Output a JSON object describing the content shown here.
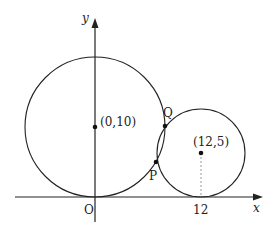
{
  "diagram": {
    "axes": {
      "x_label": "x",
      "y_label": "y",
      "origin_label": "O"
    },
    "circle_large": {
      "center_label": "(0,10)",
      "center": [
        0,
        10
      ],
      "radius": 10
    },
    "circle_small": {
      "center_label": "(12,5)",
      "center": [
        12,
        5
      ],
      "radius": 5
    },
    "tick_label": "12",
    "points": {
      "P": "P",
      "Q": "Q"
    }
  }
}
